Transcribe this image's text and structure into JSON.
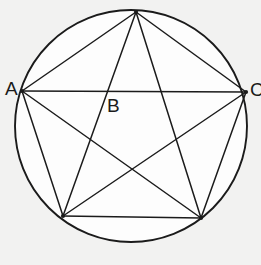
{
  "figure": {
    "background_color": "#f2f2f1",
    "interior_color": "#fdfdfd",
    "stroke_color": "#1b1b1b",
    "label_color": "#1b1b1b",
    "circle": {
      "center_x": 131,
      "center_y": 126,
      "radius": 116,
      "stroke_width": 1.9
    },
    "points": [
      {
        "id": "P_top",
        "name": "top-vertex",
        "x": 136,
        "y": 12,
        "label": ""
      },
      {
        "id": "P_left",
        "name": "left-vertex",
        "x": 22,
        "y": 91,
        "label": "A"
      },
      {
        "id": "P_right",
        "name": "right-vertex",
        "x": 246,
        "y": 92,
        "label": "C"
      },
      {
        "id": "P_bottom_left",
        "name": "bottom-left-vertex",
        "x": 63,
        "y": 216,
        "label": ""
      },
      {
        "id": "P_bottom_right",
        "name": "bottom-right-vertex",
        "x": 201,
        "y": 218,
        "label": ""
      }
    ],
    "edges": [
      {
        "name": "edge-top-left",
        "from": "P_top",
        "to": "P_left"
      },
      {
        "name": "edge-top-right",
        "from": "P_top",
        "to": "P_right"
      },
      {
        "name": "edge-top-bottom-left",
        "from": "P_top",
        "to": "P_bottom_left"
      },
      {
        "name": "edge-top-bottom-right",
        "from": "P_top",
        "to": "P_bottom_right"
      },
      {
        "name": "edge-left-right",
        "from": "P_left",
        "to": "P_right"
      },
      {
        "name": "edge-left-bottom-left",
        "from": "P_left",
        "to": "P_bottom_left"
      },
      {
        "name": "edge-left-bottom-right",
        "from": "P_left",
        "to": "P_bottom_right"
      },
      {
        "name": "edge-right-bottom-left",
        "from": "P_right",
        "to": "P_bottom_left"
      },
      {
        "name": "edge-right-bottom-right",
        "from": "P_right",
        "to": "P_bottom_right"
      },
      {
        "name": "edge-bottom-left-bottom-right",
        "from": "P_bottom_left",
        "to": "P_bottom_right"
      }
    ],
    "labels": {
      "A": {
        "text": "A",
        "x": 5,
        "y": 79,
        "anchor_point": "left-vertex"
      },
      "B": {
        "text": "B",
        "x": 107,
        "y": 96,
        "anchor_point": "interior-intersection"
      },
      "C": {
        "text": "C",
        "x": 250,
        "y": 80,
        "anchor_point": "right-vertex",
        "clipped": true
      }
    }
  }
}
